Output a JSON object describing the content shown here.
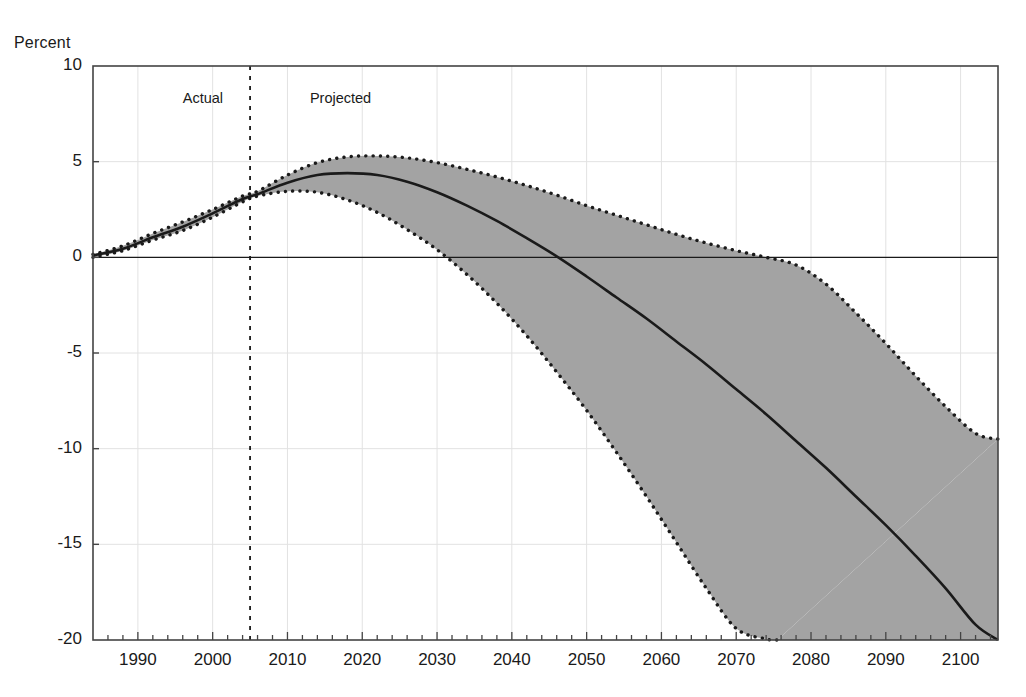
{
  "chart_data": {
    "type": "line",
    "title": "",
    "subtitle": "",
    "xlabel": "",
    "ylabel": "Percent",
    "ylabel_position": "top-left",
    "xlim": [
      1984,
      2105
    ],
    "ylim": [
      -20,
      10
    ],
    "yticks": [
      10,
      5,
      0,
      -5,
      -10,
      -15,
      -20
    ],
    "ytick_labels": [
      "10",
      "5",
      "0",
      "-5",
      "-10",
      "-15",
      "-20"
    ],
    "xticks": [
      1990,
      2000,
      2010,
      2020,
      2030,
      2040,
      2050,
      2060,
      2070,
      2080,
      2090,
      2100
    ],
    "xtick_labels": [
      "1990",
      "2000",
      "2010",
      "2020",
      "2030",
      "2040",
      "2050",
      "2060",
      "2070",
      "2080",
      "2090",
      "2100"
    ],
    "minor_xtick_interval": 2,
    "grid": "horizontal-light",
    "zero_line": true,
    "legend": "none",
    "annotations": [
      {
        "name": "actual-label",
        "text": "Actual",
        "x": 1996,
        "y": 8.3
      },
      {
        "name": "projected-label",
        "text": "Projected",
        "x": 2013,
        "y": 8.3
      },
      {
        "name": "divider-line",
        "text": "",
        "x": 2005,
        "style": "dashed-vertical"
      }
    ],
    "series": [
      {
        "name": "Intermediate projection",
        "style": "solid-line",
        "color": "#1a1a1a",
        "x": [
          1984,
          1988,
          1992,
          1996,
          2000,
          2004,
          2006,
          2010,
          2014,
          2018,
          2022,
          2026,
          2030,
          2034,
          2038,
          2042,
          2046,
          2050,
          2054,
          2058,
          2062,
          2066,
          2070,
          2074,
          2078,
          2082,
          2086,
          2090,
          2094,
          2098,
          2102,
          2105
        ],
        "values": [
          0.1,
          0.45,
          1.05,
          1.6,
          2.3,
          3.05,
          3.3,
          3.9,
          4.3,
          4.4,
          4.3,
          3.95,
          3.4,
          2.7,
          1.9,
          1.0,
          0.05,
          -1.0,
          -2.1,
          -3.2,
          -4.4,
          -5.6,
          -6.9,
          -8.2,
          -9.6,
          -11.0,
          -12.5,
          -14.0,
          -15.6,
          -17.3,
          -19.2,
          -20.0
        ]
      },
      {
        "name": "Low-cost (upper bound)",
        "style": "dotted-line",
        "color": "#1a1a1a",
        "x": [
          1984,
          1988,
          1992,
          1996,
          2000,
          2004,
          2006,
          2010,
          2014,
          2018,
          2022,
          2026,
          2030,
          2034,
          2038,
          2042,
          2046,
          2050,
          2054,
          2058,
          2062,
          2066,
          2070,
          2074,
          2078,
          2082,
          2086,
          2090,
          2094,
          2098,
          2102,
          2105
        ],
        "values": [
          0.15,
          0.6,
          1.25,
          1.85,
          2.5,
          3.2,
          3.45,
          4.3,
          4.95,
          5.25,
          5.3,
          5.2,
          4.95,
          4.6,
          4.2,
          3.75,
          3.25,
          2.7,
          2.2,
          1.7,
          1.2,
          0.75,
          0.35,
          0.0,
          -0.4,
          -1.4,
          -2.9,
          -4.5,
          -6.2,
          -7.8,
          -9.2,
          -9.5
        ]
      },
      {
        "name": "High-cost (lower bound)",
        "style": "dotted-line",
        "color": "#1a1a1a",
        "x": [
          1984,
          1988,
          1992,
          1996,
          2000,
          2004,
          2006,
          2010,
          2014,
          2018,
          2022,
          2026,
          2030,
          2034,
          2038,
          2042,
          2046,
          2050,
          2054,
          2058,
          2062,
          2066,
          2070,
          2074,
          2075.5
        ],
        "values": [
          0.0,
          0.35,
          0.9,
          1.4,
          2.1,
          2.9,
          3.2,
          3.45,
          3.4,
          3.0,
          2.35,
          1.45,
          0.4,
          -0.9,
          -2.4,
          -4.1,
          -6.0,
          -8.0,
          -10.2,
          -12.5,
          -14.9,
          -17.3,
          -19.4,
          -19.95,
          -20.0
        ]
      }
    ],
    "band": {
      "name": "projection-range-band",
      "fill_color": "#a3a3a3",
      "between": [
        "Low-cost (upper bound)",
        "High-cost (lower bound)"
      ]
    },
    "colors": {
      "axis": "#444444",
      "grid": "#e2e2e2",
      "line": "#1a1a1a",
      "band_fill": "#a3a3a3",
      "background": "#ffffff"
    }
  },
  "axis": {
    "ylabel_title": "Percent"
  }
}
